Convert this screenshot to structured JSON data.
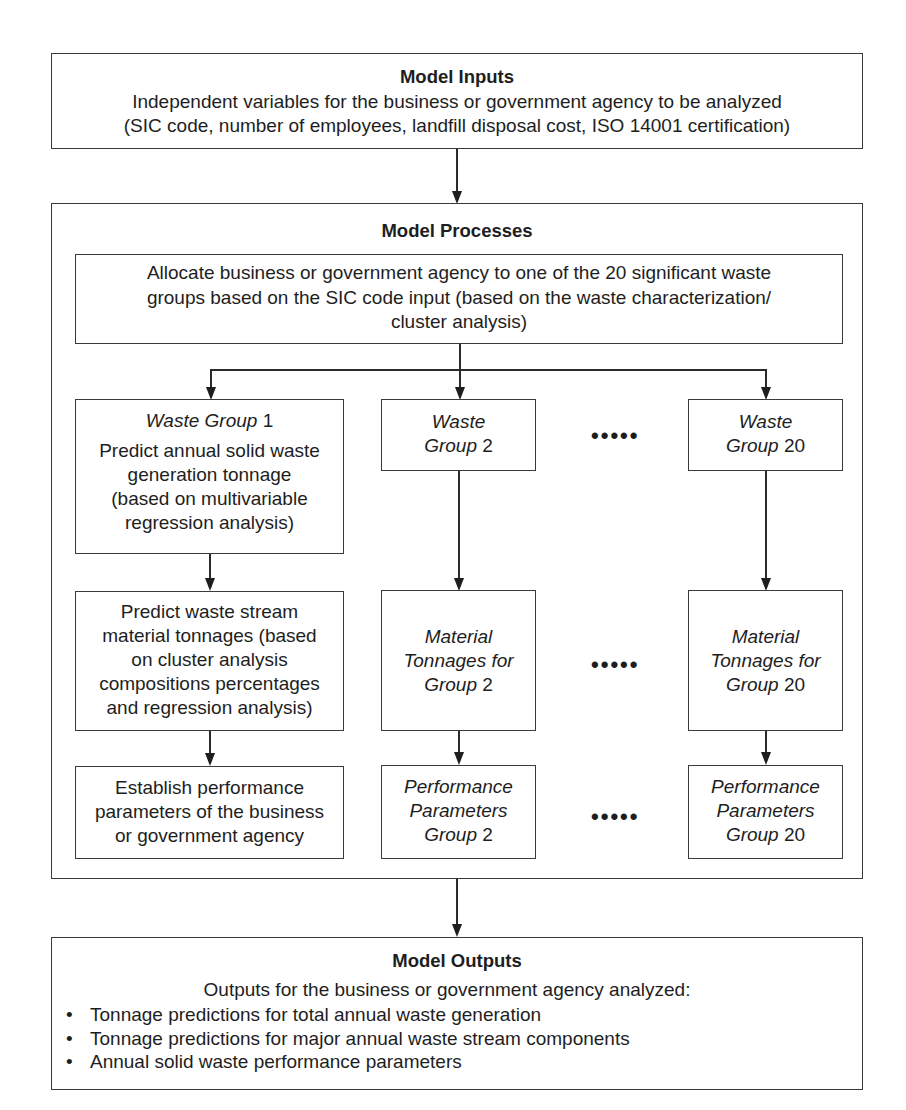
{
  "inputs": {
    "title": "Model Inputs",
    "line1": "Independent variables for the business or government agency to be analyzed",
    "line2": "(SIC code, number of employees, landfill disposal cost, ISO 14001 certification)"
  },
  "processes": {
    "title": "Model Processes",
    "allocate": {
      "line1": "Allocate business or government agency to one of the 20 significant waste",
      "line2": "groups based on the SIC code input (based on the waste characterization/",
      "line3": "cluster analysis)"
    },
    "group1": {
      "title_italic": "Waste Group",
      "title_number": "1",
      "predict_annual": [
        "Predict annual solid waste",
        "generation tonnage",
        "(based on multivariable",
        "regression analysis)"
      ],
      "predict_material": [
        "Predict waste stream",
        "material tonnages (based",
        "on cluster analysis",
        "compositions percentages",
        "and regression analysis)"
      ],
      "performance": [
        "Establish performance",
        "parameters of the business",
        "or government agency"
      ]
    },
    "group2": {
      "waste_italic": "Waste",
      "waste_group_italic": "Group",
      "number": "2",
      "material": [
        "Material",
        "Tonnages for",
        "Group"
      ],
      "performance": [
        "Performance",
        "Parameters",
        "Group"
      ]
    },
    "group20": {
      "waste_italic": "Waste",
      "waste_group_italic": "Group",
      "number": "20",
      "material": [
        "Material",
        "Tonnages for",
        "Group"
      ],
      "performance": [
        "Performance",
        "Parameters",
        "Group"
      ]
    },
    "ellipsis": "•••••"
  },
  "outputs": {
    "title": "Model Outputs",
    "intro": "Outputs for the business or government agency analyzed:",
    "bullets": [
      "Tonnage predictions for total annual waste generation",
      "Tonnage predictions for major annual waste stream components",
      "Annual solid waste performance parameters"
    ]
  }
}
